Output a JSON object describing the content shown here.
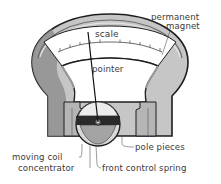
{
  "diagram": {
    "labels": {
      "permanent_magnet_line1": "permanent",
      "permanent_magnet_line2": "magnet",
      "scale": "scale",
      "pointer": "pointer",
      "pole_pieces": "pole pieces",
      "moving_coil": "moving coil",
      "concentrator": "concentrator",
      "front_control_spring": "front control spring"
    },
    "colors": {
      "magnet_light": "#c8c8c8",
      "magnet_dark": "#8e8e8e",
      "outline": "#1e1e1e",
      "scale_face": "#ffffff",
      "background": "#ffffff"
    }
  }
}
